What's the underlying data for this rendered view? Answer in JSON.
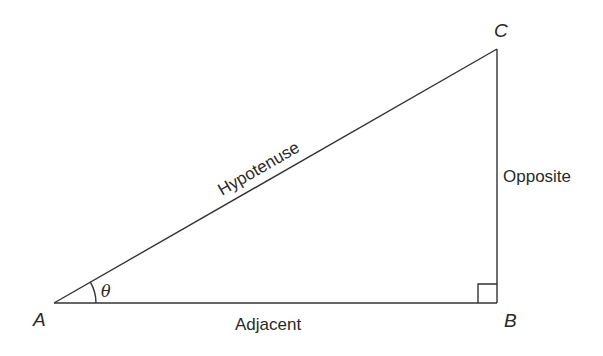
{
  "diagram": {
    "type": "right-triangle",
    "vertices": {
      "A": {
        "label": "A",
        "x": 54,
        "y": 303
      },
      "B": {
        "label": "B",
        "x": 497,
        "y": 303
      },
      "C": {
        "label": "C",
        "x": 497,
        "y": 49
      }
    },
    "sides": {
      "hypotenuse": {
        "label": "Hypotenuse"
      },
      "opposite": {
        "label": "Opposite"
      },
      "adjacent": {
        "label": "Adjacent"
      }
    },
    "angle": {
      "symbol": "θ",
      "at": "A"
    },
    "right_angle_marker": {
      "at": "B",
      "size": 19
    },
    "colors": {
      "line": "#333333",
      "text": "#2a2a2a",
      "background": "#ffffff"
    }
  }
}
